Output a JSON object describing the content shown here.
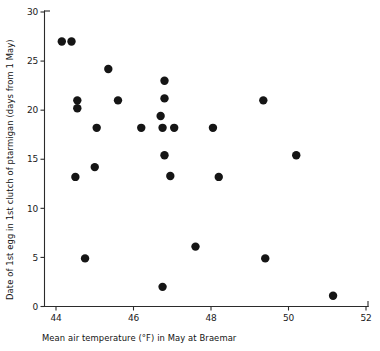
{
  "chart_data": {
    "type": "scatter",
    "title": "",
    "subtitle": "",
    "xlabel": "Mean air temperature (°F) in May at Braemar",
    "ylabel": "Date of 1st egg in 1st clutch of ptarmigan (days from 1 May)",
    "xlim": [
      43.5,
      52.2
    ],
    "ylim": [
      0,
      30
    ],
    "xticks": [
      44,
      46,
      48,
      50,
      52
    ],
    "xtick_labels": [
      "44",
      "46",
      "48",
      "50",
      "52"
    ],
    "yticks": [
      0,
      5,
      10,
      15,
      20,
      25,
      30
    ],
    "ytick_labels": [
      "0",
      "5",
      "10",
      "15",
      "20",
      "25",
      "30"
    ],
    "grid": false,
    "legend": null,
    "marker": "filled-circle",
    "marker_color": "#151515",
    "marker_size_px": 4.2,
    "points": [
      {
        "x": 44.15,
        "y": 27.0
      },
      {
        "x": 44.4,
        "y": 27.0
      },
      {
        "x": 44.55,
        "y": 21.0
      },
      {
        "x": 44.55,
        "y": 20.2
      },
      {
        "x": 44.5,
        "y": 13.2
      },
      {
        "x": 44.75,
        "y": 4.9
      },
      {
        "x": 45.05,
        "y": 18.2
      },
      {
        "x": 45.0,
        "y": 14.2
      },
      {
        "x": 45.35,
        "y": 24.2
      },
      {
        "x": 45.6,
        "y": 21.0
      },
      {
        "x": 46.2,
        "y": 18.2
      },
      {
        "x": 46.75,
        "y": 2.0
      },
      {
        "x": 46.8,
        "y": 23.0
      },
      {
        "x": 46.8,
        "y": 21.2
      },
      {
        "x": 46.7,
        "y": 19.4
      },
      {
        "x": 46.75,
        "y": 18.2
      },
      {
        "x": 47.05,
        "y": 18.2
      },
      {
        "x": 46.8,
        "y": 15.4
      },
      {
        "x": 46.95,
        "y": 13.3
      },
      {
        "x": 47.6,
        "y": 6.1
      },
      {
        "x": 48.2,
        "y": 13.2
      },
      {
        "x": 48.05,
        "y": 18.2
      },
      {
        "x": 49.35,
        "y": 21.0
      },
      {
        "x": 49.4,
        "y": 4.9
      },
      {
        "x": 50.2,
        "y": 15.4
      },
      {
        "x": 51.15,
        "y": 1.1
      }
    ]
  },
  "axes": {
    "x_axis_name": "mean-air-temperature",
    "y_axis_name": "date-of-first-egg"
  }
}
